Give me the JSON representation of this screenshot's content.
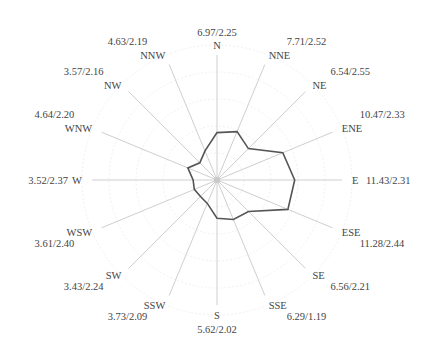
{
  "chart_data": {
    "type": "radar",
    "title": "",
    "label_format": "value1/value2",
    "directions": [
      "N",
      "NNE",
      "NE",
      "ENE",
      "E",
      "ESE",
      "SE",
      "SSE",
      "S",
      "SSW",
      "SW",
      "WSW",
      "W",
      "WNW",
      "NW",
      "NNW"
    ],
    "series": [
      {
        "name": "frequency",
        "values": [
          6.97,
          7.71,
          6.54,
          10.47,
          11.43,
          11.28,
          6.56,
          6.29,
          5.62,
          3.73,
          3.43,
          3.61,
          3.52,
          4.64,
          3.57,
          4.63
        ]
      },
      {
        "name": "mean_speed",
        "values": [
          2.25,
          2.52,
          2.55,
          2.33,
          2.31,
          2.44,
          2.21,
          1.19,
          2.02,
          2.09,
          2.24,
          2.4,
          2.37,
          2.2,
          2.16,
          2.19
        ]
      }
    ],
    "labels": [
      {
        "dir": "N",
        "text": "6.97/2.25"
      },
      {
        "dir": "NNE",
        "text": "7.71/2.52"
      },
      {
        "dir": "NE",
        "text": "6.54/2.55"
      },
      {
        "dir": "ENE",
        "text": "10.47/2.33"
      },
      {
        "dir": "E",
        "text": "11.43/2.31"
      },
      {
        "dir": "ESE",
        "text": "11.28/2.44"
      },
      {
        "dir": "SE",
        "text": "6.56/2.21"
      },
      {
        "dir": "SSE",
        "text": "6.29/1.19"
      },
      {
        "dir": "S",
        "text": "5.62/2.02"
      },
      {
        "dir": "SSW",
        "text": "3.73/2.09"
      },
      {
        "dir": "SW",
        "text": "3.43/2.24"
      },
      {
        "dir": "WSW",
        "text": "3.61/2.40"
      },
      {
        "dir": "W",
        "text": "3.52/2.37"
      },
      {
        "dir": "WNW",
        "text": "4.64/2.20"
      },
      {
        "dir": "NW",
        "text": "3.57/2.16"
      },
      {
        "dir": "NNW",
        "text": "4.63/2.19"
      }
    ],
    "grid": true,
    "legend": "none",
    "colors": {
      "polygon": "#555555",
      "spokes": "#cfcfcf",
      "rings": "#ececec",
      "text": "#444444"
    }
  }
}
